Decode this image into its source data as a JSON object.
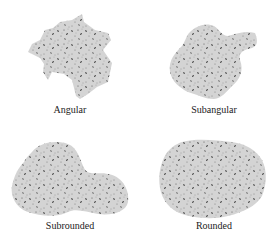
{
  "figure": {
    "panels": [
      {
        "label": "Angular",
        "class": "angular"
      },
      {
        "label": "Subangular",
        "class": "subangular"
      },
      {
        "label": "Subrounded",
        "class": "subrounded"
      },
      {
        "label": "Rounded",
        "class": "rounded"
      }
    ],
    "colors": {
      "grain_fill": "#d4d4d4",
      "speckle_dark": "#3a3a3a",
      "speckle_mid": "#7a7a7a",
      "label_text": "#222222",
      "background": "#ffffff"
    }
  }
}
